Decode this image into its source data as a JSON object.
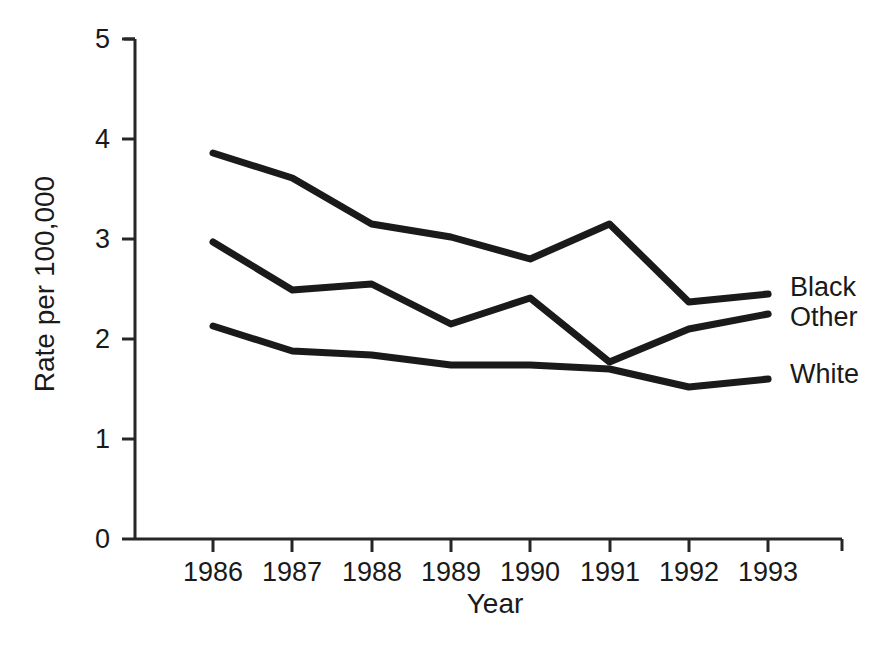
{
  "chart_data": {
    "type": "line",
    "title": "",
    "xlabel": "Year",
    "ylabel": "Rate per 100,000",
    "categories": [
      "1986",
      "1987",
      "1988",
      "1989",
      "1990",
      "1991",
      "1992",
      "1993"
    ],
    "x": [
      1986,
      1987,
      1988,
      1989,
      1990,
      1991,
      1992,
      1993
    ],
    "xlim": [
      1985.6,
      1993.9
    ],
    "ylim": [
      0,
      5
    ],
    "yticks": [
      0,
      1,
      2,
      3,
      4,
      5
    ],
    "ytick_labels": [
      "0",
      "1",
      "2",
      "3",
      "4",
      "5"
    ],
    "grid": false,
    "legend_position": "right-inline-end-of-line",
    "series": [
      {
        "name": "Black",
        "label": "Black",
        "color": "#1a1a1a",
        "values": [
          3.86,
          3.61,
          3.15,
          3.02,
          2.8,
          3.15,
          2.37,
          2.45
        ]
      },
      {
        "name": "Other",
        "label": "Other",
        "color": "#1a1a1a",
        "values": [
          2.97,
          2.49,
          2.55,
          2.15,
          2.41,
          1.77,
          2.1,
          2.25
        ]
      },
      {
        "name": "White",
        "label": "White",
        "color": "#1a1a1a",
        "values": [
          2.13,
          1.88,
          1.84,
          1.74,
          1.74,
          1.7,
          1.52,
          1.6
        ]
      }
    ]
  },
  "axes": {
    "y_tick_0": "0",
    "y_tick_1": "1",
    "y_tick_2": "2",
    "y_tick_3": "3",
    "y_tick_4": "4",
    "y_tick_5": "5",
    "x_tick_0": "1986",
    "x_tick_1": "1987",
    "x_tick_2": "1988",
    "x_tick_3": "1989",
    "x_tick_4": "1990",
    "x_tick_5": "1991",
    "x_tick_6": "1992",
    "x_tick_7": "1993",
    "x_axis_title": "Year",
    "y_axis_title": "Rate per 100,000"
  },
  "series_labels": {
    "black": "Black",
    "other": "Other",
    "white": "White"
  },
  "style": {
    "line_color": "#1a1a1a",
    "axis_color": "#262626",
    "background": "#ffffff"
  }
}
